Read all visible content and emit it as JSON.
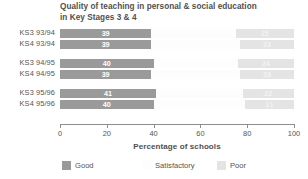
{
  "chart_data": {
    "type": "bar",
    "orientation": "horizontal",
    "stacked": true,
    "stack_total": 100,
    "title": "Quality of teaching in personal & social education in Key Stages 3 & 4",
    "title_lines": [
      "Quality of teaching in personal & social education",
      "in Key Stages 3 & 4"
    ],
    "xlabel": "Percentage of schools",
    "ylabel": "",
    "xlim": [
      0,
      100
    ],
    "xticks": [
      0,
      20,
      40,
      60,
      80,
      100
    ],
    "xtick_labels": [
      "0",
      "20",
      "40",
      "60",
      "80",
      "100"
    ],
    "grid": false,
    "legend_position": "bottom-left",
    "categories": [
      "KS3 93/94",
      "KS4 93/94",
      "KS3 94/95",
      "KS4 94/95",
      "KS3 95/96",
      "KS4 95/96"
    ],
    "category_groups": [
      {
        "name": "1993/94",
        "categories": [
          "KS3 93/94",
          "KS4 93/94"
        ]
      },
      {
        "name": "1994/95",
        "categories": [
          "KS3 94/95",
          "KS4 94/95"
        ]
      },
      {
        "name": "1995/96",
        "categories": [
          "KS3 95/96",
          "KS4 95/96"
        ]
      }
    ],
    "series": [
      {
        "name": "Good",
        "color": "#9a9a9a",
        "values": [
          39,
          39,
          40,
          39,
          41,
          40
        ],
        "labels": [
          "39",
          "39",
          "40",
          "39",
          "41",
          "40"
        ]
      },
      {
        "name": "Satisfactory",
        "color": "#fdfdfd",
        "values": [
          36,
          38,
          36,
          38,
          37,
          39
        ],
        "labels": [
          "",
          "",
          "",
          "",
          "",
          ""
        ]
      },
      {
        "name": "Poor",
        "color": "#e4e4e4",
        "values": [
          25,
          23,
          24,
          23,
          22,
          21
        ],
        "labels": [
          "25",
          "23",
          "24",
          "23",
          "22",
          "21"
        ]
      }
    ]
  },
  "legend": {
    "items": [
      {
        "label": "Good",
        "color": "#9a9a9a"
      },
      {
        "label": "Satisfactory",
        "color": "#fdfdfd"
      },
      {
        "label": "Poor",
        "color": "#e4e4e4"
      }
    ]
  }
}
